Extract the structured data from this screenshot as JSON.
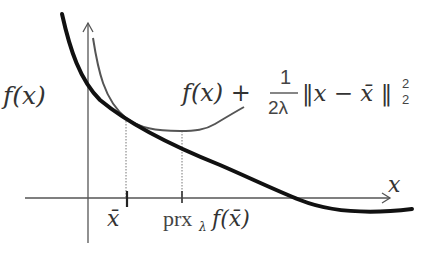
{
  "diagram": {
    "labels": {
      "fx": "f(x)",
      "moreau_f": "f(x) +",
      "moreau_num": "1",
      "moreau_den": "2λ",
      "moreau_norm": "‖x − x̄ ‖",
      "moreau_sup": "2",
      "moreau_sub": "2",
      "x_axis": "x",
      "xbar": "x̄",
      "prox_name": "prx",
      "prox_sub": "λ",
      "prox_arg": "f(x̄)"
    },
    "colors": {
      "f_curve": "#111111",
      "envelope_curve": "#555555",
      "axes": "#444444",
      "guides": "#666666",
      "text": "#333333"
    },
    "curves": [
      {
        "name": "f(x)",
        "style": "thick-black"
      },
      {
        "name": "f(x) + 1/(2λ)||x - x̄||_2^2",
        "style": "thin-gray"
      }
    ],
    "ticks": [
      {
        "label": "x̄",
        "x": 127
      },
      {
        "label": "prx_λ f(x̄)",
        "x": 182
      }
    ]
  }
}
